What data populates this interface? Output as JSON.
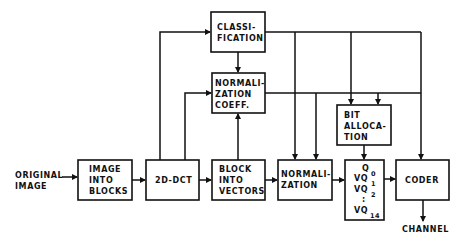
{
  "diagram": {
    "title": "",
    "input_label": [
      "ORIGINAL",
      "IMAGE"
    ],
    "output_label": "CHANNEL",
    "blocks": {
      "image_into_blocks": [
        "IMAGE",
        "INTO",
        "BLOCKS"
      ],
      "dct": [
        "2D-DCT"
      ],
      "block_into_vectors": [
        "BLOCK",
        "INTO",
        "VECTORS"
      ],
      "normalization": [
        "NORMALI-",
        "ZATION"
      ],
      "classification": [
        "CLASSI-",
        "FICATION"
      ],
      "normalization_coeff": [
        "NORMALI-",
        "ZATION",
        "COEFF."
      ],
      "bit_allocation": [
        "BIT",
        "ALLOCA-",
        "TION"
      ],
      "vq": {
        "lines": [
          {
            "main": "Q",
            "sub": "0"
          },
          {
            "main": "VQ",
            "sub": "1"
          },
          {
            "main": "VQ",
            "sub": "2"
          },
          {
            "main": ":",
            "sub": ""
          },
          {
            "main": "VQ",
            "sub": "14"
          }
        ]
      },
      "coder": [
        "CODER"
      ]
    },
    "edges": [
      [
        "original_image",
        "image_into_blocks"
      ],
      [
        "image_into_blocks",
        "dct"
      ],
      [
        "dct",
        "block_into_vectors"
      ],
      [
        "dct",
        "classification"
      ],
      [
        "dct",
        "normalization_coeff"
      ],
      [
        "classification",
        "normalization_coeff"
      ],
      [
        "block_into_vectors",
        "normalization_coeff"
      ],
      [
        "block_into_vectors",
        "normalization"
      ],
      [
        "classification",
        "normalization"
      ],
      [
        "normalization_coeff",
        "normalization"
      ],
      [
        "classification",
        "bit_allocation"
      ],
      [
        "normalization_coeff",
        "bit_allocation"
      ],
      [
        "classification",
        "coder"
      ],
      [
        "normalization",
        "vq"
      ],
      [
        "bit_allocation",
        "vq"
      ],
      [
        "vq",
        "coder"
      ],
      [
        "coder",
        "channel"
      ]
    ]
  }
}
